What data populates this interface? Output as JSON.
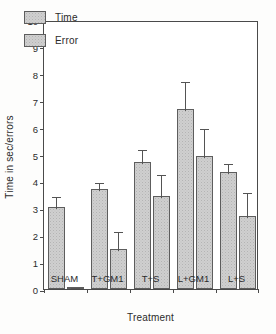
{
  "chart_data": {
    "type": "bar",
    "title": "",
    "xlabel": "Treatment",
    "ylabel": "Time in sec/errors",
    "categories": [
      "SHAM",
      "T+GM1",
      "T+S",
      "L+GM1",
      "L+S"
    ],
    "series": [
      {
        "name": "Time",
        "values": [
          3.05,
          3.7,
          4.72,
          6.68,
          4.35
        ],
        "errors": [
          0.45,
          0.3,
          0.52,
          1.08,
          0.38
        ]
      },
      {
        "name": "Error",
        "values": [
          0.07,
          1.48,
          3.47,
          4.93,
          2.73
        ],
        "errors": [
          0.03,
          0.72,
          0.85,
          1.1,
          0.9
        ]
      }
    ],
    "ylim": [
      0,
      10
    ],
    "yticks": [
      0,
      1,
      2,
      3,
      4,
      5,
      6,
      7,
      8,
      9,
      10
    ],
    "ytick_labels": [
      "0",
      "1",
      "2",
      "3",
      "4",
      "5",
      "6",
      "7",
      "8",
      "9",
      "10"
    ],
    "grid": false,
    "legend_position": "upper-left",
    "error_bar_style": "upper-only-with-caps",
    "bar_fill_color": "#cfcfcf",
    "bar_edge_color": "#5d5d5d",
    "axis_color": "#4a4a4a",
    "background_color": "#ffffff"
  },
  "legend": {
    "items": [
      {
        "label": "Time"
      },
      {
        "label": "Error"
      }
    ]
  }
}
